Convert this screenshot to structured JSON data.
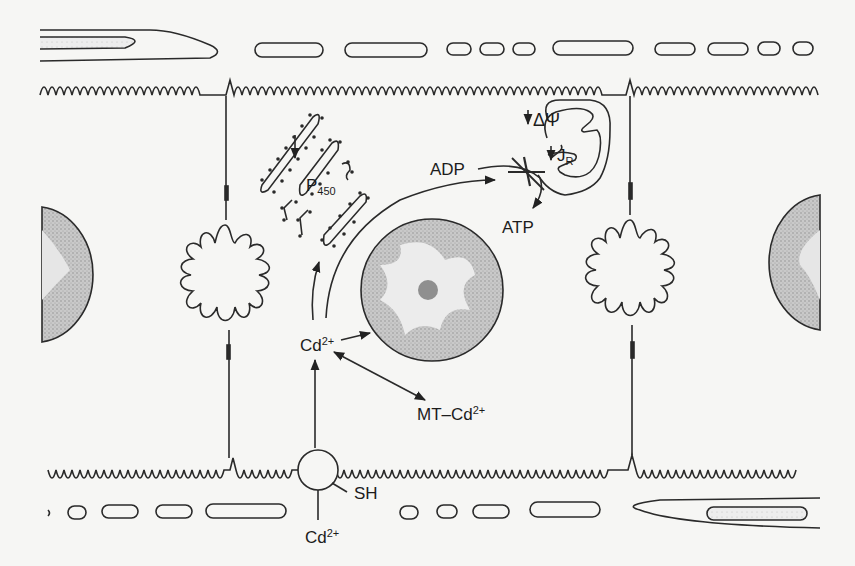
{
  "figure": {
    "type": "cell-diagram",
    "colors": {
      "line": "#2a2a2a",
      "background": "#f6f6f4",
      "stipple": "#a9a9a9"
    }
  },
  "labels": {
    "adp": "ADP",
    "atp": "ATP",
    "delta_psi_symbol": "ΔΨ",
    "jr_main": "J",
    "jr_sub": "R",
    "p450_main": "P",
    "p450_sub": "450",
    "cd_cytosol_main": "Cd",
    "cd_cytosol_sup": "2+",
    "mt_cd_main": "MT–Cd",
    "mt_cd_sup": "2+",
    "sh": "SH",
    "cd_extracellular_main": "Cd",
    "cd_extracellular_sup": "2+"
  },
  "structures": [
    "apical-membrane-microvilli",
    "basolateral-membrane-microvilli",
    "endoplasmic-reticulum-p450",
    "mitochondrion",
    "nucleus",
    "neighbor-nucleus-left",
    "neighbor-nucleus-right",
    "desmosome-left",
    "desmosome-right",
    "membrane-transporter-sh",
    "capillary-top",
    "capillary-bottom"
  ]
}
